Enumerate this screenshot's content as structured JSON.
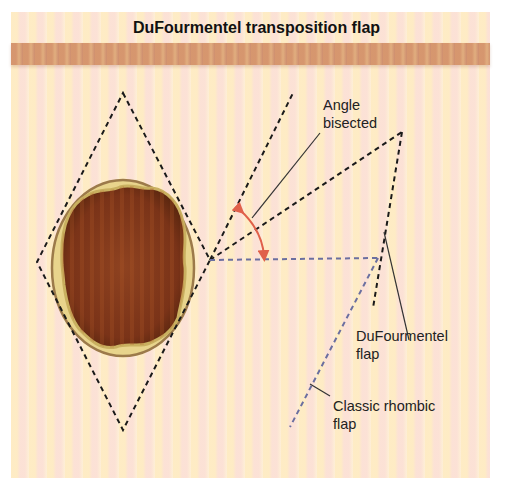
{
  "title": "DuFourmentel transposition flap",
  "labels": {
    "angle_bisected": [
      "Angle",
      "bisected"
    ],
    "dufourmentel_flap": [
      "DuFourmentel",
      "flap"
    ],
    "classic_rhombic_flap": [
      "Classic rhombic",
      "flap"
    ]
  },
  "colors": {
    "dashed_line": "#1a1a1a",
    "classic_line": "#6b6fa0",
    "angle_arc": "#e0604a",
    "wound_outer": "#c8ad5c",
    "wound_inner": "#8a3a1c",
    "header_bar": "#d59a74",
    "background": "#fdebd9"
  },
  "geometry": {
    "rhombus_defect": {
      "top": [
        123,
        93
      ],
      "left": [
        37,
        262
      ],
      "bottom": [
        123,
        430
      ],
      "right": [
        210,
        260
      ]
    },
    "flap_apex": [
      210,
      260
    ],
    "extension_line_end": [
      293,
      93
    ],
    "bisector_end": [
      402,
      132
    ],
    "dufourmentel_flap_tip": [
      373,
      308
    ],
    "horizontal_extension_end": [
      378,
      258
    ],
    "classic_flap_end": [
      290,
      427
    ]
  }
}
